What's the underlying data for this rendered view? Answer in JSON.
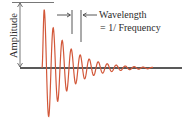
{
  "diagram": {
    "labels": {
      "amplitude": "Amplitude",
      "wavelength": "Wavelength",
      "frequency_eq": "= 1/ Frequency"
    },
    "colors": {
      "wave": "#d2583a",
      "axis": "#222222",
      "annotation": "#444444",
      "text": "#2b2b2b"
    },
    "wave": {
      "start_x": 42,
      "end_x": 153,
      "baseline_y": 68,
      "initial_amplitude": 64,
      "period_px": 9,
      "decay": 0.026
    }
  }
}
